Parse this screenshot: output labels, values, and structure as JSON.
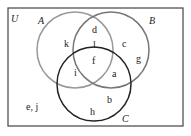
{
  "universe_label": "U",
  "sets": {
    "A": {
      "label": "A",
      "color": "#8a8a8a"
    },
    "B": {
      "label": "B",
      "color": "#6a6a6a"
    },
    "C": {
      "label": "C",
      "color": "#222222"
    }
  },
  "regions": {
    "only_A": "k",
    "A_B_only_top": "d",
    "A_B_only": "l",
    "only_B": "c",
    "only_B_2": "g",
    "A_B_C": "f",
    "A_C_only": "i",
    "B_C_only": "a",
    "only_C_1": "b",
    "only_C_2": "h",
    "outside": "e, j"
  }
}
